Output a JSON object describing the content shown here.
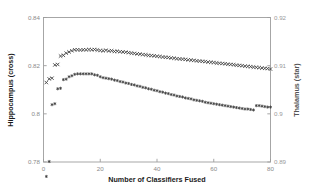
{
  "chart_data": {
    "type": "scatter",
    "title": "",
    "xlabel": "Number of Classifiers Fused",
    "ylabel": "Hippocampus (cross)",
    "ylabel_right": "Thalamus (star)",
    "xlim": [
      0,
      80
    ],
    "ylim": [
      0.78,
      0.84
    ],
    "ylim_right": [
      0.89,
      0.92
    ],
    "xticks": [
      "0",
      "20",
      "40",
      "60",
      "80"
    ],
    "xtick_values": [
      0,
      20,
      40,
      60,
      80
    ],
    "yticks": [
      "0.78",
      "0.8",
      "0.82",
      "0.84"
    ],
    "ytick_values": [
      0.78,
      0.8,
      0.82,
      0.84
    ],
    "yticks_right": [
      "0.89",
      "0.9",
      "0.91",
      "0.92"
    ],
    "ytick_values_right": [
      0.89,
      0.9,
      0.91,
      0.92
    ],
    "grid": false,
    "legend": "none",
    "series": [
      {
        "name": "Hippocampus (cross)",
        "marker": "cross",
        "axis": "left",
        "color": "#3c3c3c",
        "x": [
          1,
          2,
          3,
          4,
          5,
          6,
          7,
          8,
          9,
          10,
          11,
          12,
          13,
          14,
          15,
          16,
          17,
          18,
          19,
          20,
          21,
          22,
          23,
          24,
          25,
          26,
          27,
          28,
          29,
          30,
          31,
          32,
          33,
          34,
          35,
          36,
          37,
          38,
          39,
          40,
          41,
          42,
          43,
          44,
          45,
          46,
          47,
          48,
          49,
          50,
          51,
          52,
          53,
          54,
          55,
          56,
          57,
          58,
          59,
          60,
          61,
          62,
          63,
          64,
          65,
          66,
          67,
          68,
          69,
          70,
          71,
          72,
          73,
          74,
          75,
          76,
          77,
          78,
          79,
          80
        ],
        "y": [
          0.813,
          0.8145,
          0.8148,
          0.8203,
          0.8205,
          0.824,
          0.8243,
          0.8252,
          0.8257,
          0.8262,
          0.8266,
          0.8266,
          0.8265,
          0.8266,
          0.8266,
          0.8267,
          0.8266,
          0.8267,
          0.8265,
          0.8263,
          0.8262,
          0.8264,
          0.8261,
          0.8262,
          0.8259,
          0.826,
          0.8258,
          0.8257,
          0.8256,
          0.8254,
          0.8252,
          0.8251,
          0.8249,
          0.8248,
          0.8246,
          0.8245,
          0.8243,
          0.8242,
          0.8241,
          0.8239,
          0.8238,
          0.8236,
          0.8235,
          0.8234,
          0.8232,
          0.8231,
          0.8229,
          0.8228,
          0.8227,
          0.8226,
          0.8224,
          0.8223,
          0.8222,
          0.822,
          0.8219,
          0.8218,
          0.8217,
          0.8215,
          0.8214,
          0.8213,
          0.8211,
          0.821,
          0.8209,
          0.8208,
          0.8206,
          0.8205,
          0.8204,
          0.8202,
          0.8201,
          0.82,
          0.8198,
          0.8197,
          0.8196,
          0.8194,
          0.8193,
          0.8192,
          0.819,
          0.8189,
          0.8188,
          0.8186
        ]
      },
      {
        "name": "Thalamus (star)",
        "marker": "star",
        "axis": "right",
        "color": "#3c3c3c",
        "x": [
          1,
          2,
          3,
          4,
          5,
          6,
          7,
          8,
          9,
          10,
          11,
          12,
          13,
          14,
          15,
          16,
          17,
          18,
          19,
          20,
          21,
          22,
          23,
          24,
          25,
          26,
          27,
          28,
          29,
          30,
          31,
          32,
          33,
          34,
          35,
          36,
          37,
          38,
          39,
          40,
          41,
          42,
          43,
          44,
          45,
          46,
          47,
          48,
          49,
          50,
          51,
          52,
          53,
          54,
          55,
          56,
          57,
          58,
          59,
          60,
          61,
          62,
          63,
          64,
          65,
          66,
          67,
          68,
          69,
          70,
          71,
          72,
          73,
          74,
          75,
          76,
          77,
          78,
          79,
          80
        ],
        "y_left_equivalent": [
          0.784,
          0.7902,
          0.8138,
          0.8142,
          0.8204,
          0.8206,
          0.8241,
          0.8244,
          0.8253,
          0.8258,
          0.8263,
          0.8266,
          0.8266,
          0.8266,
          0.8265,
          0.8266,
          0.8265,
          0.8262,
          0.8259,
          0.8253,
          0.825,
          0.8248,
          0.8245,
          0.8243,
          0.824,
          0.8237,
          0.8234,
          0.8231,
          0.8228,
          0.8225,
          0.8222,
          0.8219,
          0.8216,
          0.8213,
          0.821,
          0.8207,
          0.8204,
          0.8201,
          0.8198,
          0.8195,
          0.8192,
          0.8189,
          0.8186,
          0.8183,
          0.818,
          0.8177,
          0.8174,
          0.8171,
          0.8169,
          0.8166,
          0.8163,
          0.8161,
          0.8158,
          0.8156,
          0.8153,
          0.8151,
          0.8148,
          0.8146,
          0.8144,
          0.8141,
          0.8139,
          0.8137,
          0.8135,
          0.8133,
          0.8131,
          0.8129,
          0.8127,
          0.8125,
          0.8123,
          0.8122,
          0.812,
          0.8119,
          0.8117,
          0.8116,
          0.8134,
          0.8133,
          0.8131,
          0.813,
          0.8128,
          0.8127
        ],
        "y": [
          0.887,
          0.8901,
          0.9019,
          0.9021,
          0.9052,
          0.9053,
          0.9071,
          0.9072,
          0.9077,
          0.9079,
          0.9082,
          0.9083,
          0.9083,
          0.9083,
          0.9083,
          0.9083,
          0.9083,
          0.9081,
          0.908,
          0.9077,
          0.9075,
          0.9074,
          0.9073,
          0.9072,
          0.907,
          0.9069,
          0.9067,
          0.9066,
          0.9064,
          0.9063,
          0.9061,
          0.906,
          0.9058,
          0.9057,
          0.9055,
          0.9054,
          0.9052,
          0.9051,
          0.9049,
          0.9048,
          0.9046,
          0.9045,
          0.9043,
          0.9042,
          0.904,
          0.9039,
          0.9037,
          0.9036,
          0.9035,
          0.9033,
          0.9032,
          0.9031,
          0.9029,
          0.9028,
          0.9027,
          0.9026,
          0.9024,
          0.9023,
          0.9022,
          0.9021,
          0.902,
          0.9019,
          0.9018,
          0.9017,
          0.9016,
          0.9015,
          0.9014,
          0.9013,
          0.9012,
          0.9011,
          0.901,
          0.901,
          0.9009,
          0.9008,
          0.9017,
          0.9017,
          0.9016,
          0.9015,
          0.9014,
          0.9014
        ]
      }
    ]
  }
}
